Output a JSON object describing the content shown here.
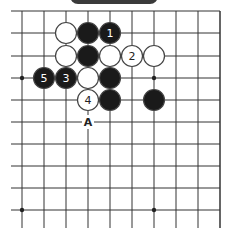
{
  "diagram": {
    "type": "go-board-fragment",
    "grid": {
      "x_lines": [
        22,
        44,
        66,
        88,
        110,
        132,
        154,
        176,
        198,
        220
      ],
      "y_lines": [
        11,
        33,
        56,
        78,
        100,
        122,
        144,
        166,
        188,
        210
      ],
      "top_edge": true,
      "line_color": "#333333"
    },
    "star_points": [
      [
        22,
        78
      ],
      [
        154,
        78
      ],
      [
        22,
        210
      ],
      [
        154,
        210
      ]
    ],
    "stones": [
      {
        "color": "white",
        "x": 66,
        "y": 33,
        "label": ""
      },
      {
        "color": "black",
        "x": 88,
        "y": 33,
        "label": ""
      },
      {
        "color": "black",
        "x": 110,
        "y": 33,
        "label": "1"
      },
      {
        "color": "white",
        "x": 66,
        "y": 56,
        "label": ""
      },
      {
        "color": "black",
        "x": 88,
        "y": 56,
        "label": ""
      },
      {
        "color": "white",
        "x": 110,
        "y": 56,
        "label": ""
      },
      {
        "color": "white",
        "x": 132,
        "y": 56,
        "label": "2"
      },
      {
        "color": "white",
        "x": 154,
        "y": 56,
        "label": ""
      },
      {
        "color": "black",
        "x": 44,
        "y": 78,
        "label": "5"
      },
      {
        "color": "black",
        "x": 66,
        "y": 78,
        "label": "3"
      },
      {
        "color": "white",
        "x": 88,
        "y": 78,
        "label": ""
      },
      {
        "color": "black",
        "x": 110,
        "y": 78,
        "label": ""
      },
      {
        "color": "white",
        "x": 88,
        "y": 100,
        "label": "4"
      },
      {
        "color": "black",
        "x": 110,
        "y": 100,
        "label": ""
      },
      {
        "color": "black",
        "x": 154,
        "y": 100,
        "label": ""
      }
    ],
    "markers": [
      {
        "text": "A",
        "x": 88,
        "y": 122
      }
    ],
    "colors": {
      "black_stone": "#1a1a1a",
      "white_stone": "#ffffff",
      "stone_outline": "#444444"
    }
  }
}
